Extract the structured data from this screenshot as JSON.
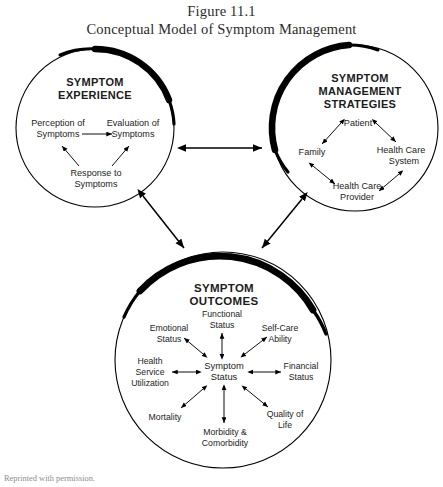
{
  "figure": {
    "number_line": "Figure 11.1",
    "title_line": "Conceptual Model of Symptom Management",
    "footer_caption": "Reprinted with permission."
  },
  "circles": {
    "experience": {
      "heading_line_1": "SYMPTOM",
      "heading_line_2": "EXPERIENCE",
      "nodes": [
        {
          "id": "perception",
          "line_1": "Perception of",
          "line_2": "Symptoms"
        },
        {
          "id": "evaluation",
          "line_1": "Evaluation of",
          "line_2": "Symptoms"
        },
        {
          "id": "response",
          "line_1": "Response to",
          "line_2": "Symptoms"
        }
      ]
    },
    "strategies": {
      "heading_line_1": "SYMPTOM",
      "heading_line_2": "MANAGEMENT",
      "heading_line_3": "STRATEGIES",
      "nodes": [
        {
          "id": "patient",
          "line_1": "Patient",
          "line_2": ""
        },
        {
          "id": "family",
          "line_1": "Family",
          "line_2": ""
        },
        {
          "id": "health-care-system",
          "line_1": "Health Care",
          "line_2": "System"
        },
        {
          "id": "health-care-provider",
          "line_1": "Health Care",
          "line_2": "Provider"
        }
      ]
    },
    "outcomes": {
      "heading_line_1": "SYMPTOM",
      "heading_line_2": "OUTCOMES",
      "hub": {
        "id": "symptom-status",
        "line_1": "Symptom",
        "line_2": "Status"
      },
      "nodes": [
        {
          "id": "functional-status",
          "line_1": "Functional",
          "line_2": "Status"
        },
        {
          "id": "self-care-ability",
          "line_1": "Self-Care",
          "line_2": "Ability"
        },
        {
          "id": "financial-status",
          "line_1": "Financial",
          "line_2": "Status"
        },
        {
          "id": "quality-of-life",
          "line_1": "Quality of",
          "line_2": "Life"
        },
        {
          "id": "morbidity-comorbidity",
          "line_1": "Morbidity &",
          "line_2": "Comorbidity"
        },
        {
          "id": "mortality",
          "line_1": "Mortality",
          "line_2": ""
        },
        {
          "id": "health-service-utilization",
          "line_1": "Health",
          "line_2": "Service",
          "line_3": "Utilization"
        },
        {
          "id": "emotional-status",
          "line_1": "Emotional",
          "line_2": "Status"
        }
      ]
    }
  },
  "colors": {
    "stroke": "#000000",
    "text": "#1c1c1c",
    "title_text": "#2b2b2b",
    "background": "#ffffff",
    "caption_text": "#8d8d8d"
  }
}
